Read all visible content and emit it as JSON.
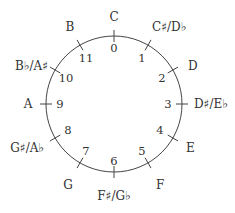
{
  "diagram": {
    "type": "pitch-class circle",
    "center": [
      114,
      104
    ],
    "radius": 68,
    "stroke_color": "#444444",
    "positions": [
      {
        "pc": "0",
        "note": "C"
      },
      {
        "pc": "1",
        "note": "C♯/D♭"
      },
      {
        "pc": "2",
        "note": "D"
      },
      {
        "pc": "3",
        "note": "D♯/E♭"
      },
      {
        "pc": "4",
        "note": "E"
      },
      {
        "pc": "5",
        "note": "F"
      },
      {
        "pc": "6",
        "note": "F♯/G♭"
      },
      {
        "pc": "7",
        "note": "G"
      },
      {
        "pc": "8",
        "note": "G♯/A♭"
      },
      {
        "pc": "9",
        "note": "A"
      },
      {
        "pc": "10",
        "note": "B♭/A♯"
      },
      {
        "pc": "11",
        "note": "B"
      }
    ]
  }
}
